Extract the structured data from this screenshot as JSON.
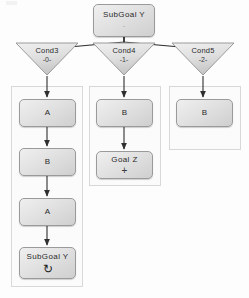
{
  "diagram": {
    "type": "behavior-tree-flowchart",
    "title_node": {
      "name": "root",
      "label": "SubGoal Y",
      "sublabel": "-",
      "shape": "rounded-rect"
    },
    "conditions": [
      {
        "name": "cond3",
        "label": "Cond3",
        "sublabel": "-0-",
        "shape": "triangle"
      },
      {
        "name": "cond4",
        "label": "Cond4",
        "sublabel": "-1-",
        "shape": "triangle"
      },
      {
        "name": "cond5",
        "label": "Cond5",
        "sublabel": "-2-",
        "shape": "triangle"
      }
    ],
    "branches": [
      {
        "name": "branch-left",
        "nodes": [
          {
            "name": "left-a",
            "label": "A",
            "sublabel": ""
          },
          {
            "name": "left-b",
            "label": "B",
            "sublabel": ""
          },
          {
            "name": "left-a2",
            "label": "A",
            "sublabel": ""
          },
          {
            "name": "left-subgoal",
            "label": "SubGoal Y",
            "sublabel": "↻"
          }
        ]
      },
      {
        "name": "branch-middle",
        "nodes": [
          {
            "name": "mid-b",
            "label": "B",
            "sublabel": ""
          },
          {
            "name": "mid-goal-z",
            "label": "Goal Z",
            "sublabel": "+"
          }
        ]
      },
      {
        "name": "branch-right",
        "nodes": [
          {
            "name": "right-b",
            "label": "B",
            "sublabel": ""
          }
        ]
      }
    ],
    "colors": {
      "node_border": "#9a9a9a",
      "node_fill_light": "#efefef",
      "node_fill_dark": "#cfcfcf",
      "edge": "#2f2f2f",
      "group_border": "#d8d8d8",
      "background": "#fdfdfd"
    }
  }
}
